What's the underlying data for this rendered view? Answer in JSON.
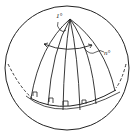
{
  "diagram": {
    "type": "spherical-lune-diagram",
    "labels": {
      "apex_angle": "1°",
      "arc_angle": "n°"
    },
    "meridian_count": 6,
    "right_angle_marks": 4,
    "colors": {
      "stroke": "#222222",
      "background": "#ffffff"
    }
  }
}
